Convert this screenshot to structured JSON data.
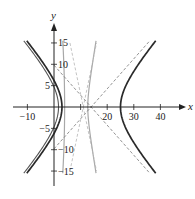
{
  "chart_data": {
    "type": "line",
    "title": "",
    "xlabel": "x",
    "ylabel": "y",
    "xlim": [
      -15,
      45
    ],
    "ylim": [
      -19,
      19
    ],
    "grid": false,
    "legend": null,
    "x_ticks": [
      -10,
      10,
      20,
      30,
      40
    ],
    "x_tick_labels": [
      "−10",
      "20",
      "30",
      "40"
    ],
    "x_tick_labeled_values": [
      -10,
      20,
      30,
      40
    ],
    "y_ticks": [
      15,
      10,
      5,
      -5,
      -10,
      -15
    ],
    "y_tick_labels": [
      "15",
      "10",
      "5",
      "−5",
      "−10",
      "−15"
    ],
    "series": [
      {
        "name": "main hyperbola (left branch)",
        "style": "solid-dark-thick",
        "color": "#2a2a2a",
        "center": [
          14,
          0
        ],
        "a": 11,
        "b": 7.9,
        "branch": "left",
        "vertex": [
          3,
          0
        ]
      },
      {
        "name": "main hyperbola (right branch)",
        "style": "solid-dark-thick",
        "color": "#2a2a2a",
        "center": [
          14,
          0
        ],
        "a": 11,
        "b": 7.9,
        "branch": "right",
        "vertex": [
          25,
          0
        ]
      },
      {
        "name": "inner hyperbola (left branch)",
        "style": "solid-medium",
        "color": "#555555",
        "center": [
          14,
          0
        ],
        "a": 12.3,
        "b": 8.6,
        "branch": "left",
        "vertex": [
          1.7,
          0
        ]
      },
      {
        "name": "narrow hyperbola (left branch)",
        "style": "solid-light",
        "color": "#a8a8a8",
        "center": [
          11.5,
          0
        ],
        "a": 7.5,
        "b": 35,
        "branch": "left",
        "vertex": [
          4,
          0
        ]
      },
      {
        "name": "narrow hyperbola (right branch)",
        "style": "solid-light",
        "color": "#a8a8a8",
        "center": [
          11.5,
          0
        ],
        "a": 1.2,
        "b": 4.5,
        "branch": "right",
        "vertex": [
          7.5,
          0
        ]
      },
      {
        "name": "asymptotes",
        "style": "dashed",
        "color": "#777777",
        "lines": [
          {
            "from": [
              0,
              9.8
            ],
            "to": [
              36,
              -15.5
            ]
          },
          {
            "from": [
              0,
              -9.8
            ],
            "to": [
              36,
              15.5
            ]
          }
        ],
        "intersection": [
          13.4,
          0
        ]
      },
      {
        "name": "narrow asymptotes",
        "style": "dashed-light",
        "color": "#b5b5b5",
        "lines": [
          {
            "from": [
              6,
              15
            ],
            "to": [
              16,
              -15
            ]
          },
          {
            "from": [
              6,
              -15
            ],
            "to": [
              16,
              15
            ]
          }
        ]
      }
    ]
  },
  "axes": {
    "x_label": "x",
    "y_label": "y"
  }
}
